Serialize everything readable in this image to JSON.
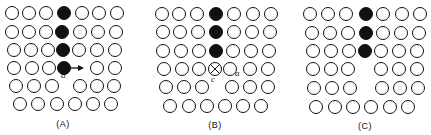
{
  "panels": [
    {
      "label": "(A)",
      "annotation": "a",
      "description": "Vacancy migration: atom moves right into vacancy (arrow a)",
      "rows": [
        {
          "y": 13,
          "cells": [
            {
              "x": 12,
              "t": "o"
            },
            {
              "x": 29,
              "t": "o"
            },
            {
              "x": 46,
              "t": "o"
            },
            {
              "x": 64,
              "t": "f"
            },
            {
              "x": 82,
              "t": "o"
            },
            {
              "x": 99,
              "t": "o"
            },
            {
              "x": 117,
              "t": "o"
            }
          ]
        },
        {
          "y": 32,
          "cells": [
            {
              "x": 12,
              "t": "o"
            },
            {
              "x": 29,
              "t": "o"
            },
            {
              "x": 46,
              "t": "o"
            },
            {
              "x": 62,
              "t": "f"
            },
            {
              "x": 80,
              "t": "o"
            },
            {
              "x": 98,
              "t": "o"
            },
            {
              "x": 116,
              "t": "o"
            }
          ]
        },
        {
          "y": 50,
          "cells": [
            {
              "x": 14,
              "t": "o"
            },
            {
              "x": 31,
              "t": "o"
            },
            {
              "x": 48,
              "t": "o"
            },
            {
              "x": 63,
              "t": "f"
            },
            {
              "x": 79,
              "t": "o"
            },
            {
              "x": 97,
              "t": "o"
            },
            {
              "x": 115,
              "t": "o"
            }
          ]
        },
        {
          "y": 68,
          "cells": [
            {
              "x": 14,
              "t": "o"
            },
            {
              "x": 32,
              "t": "o"
            },
            {
              "x": 49,
              "t": "o"
            },
            {
              "x": 64,
              "t": "f"
            },
            {
              "x": 97,
              "t": "o"
            },
            {
              "x": 115,
              "t": "o"
            }
          ]
        },
        {
          "y": 86,
          "cells": [
            {
              "x": 16,
              "t": "o"
            },
            {
              "x": 34,
              "t": "o"
            },
            {
              "x": 52,
              "t": "o"
            },
            {
              "x": 80,
              "t": "o"
            },
            {
              "x": 97,
              "t": "o"
            },
            {
              "x": 114,
              "t": "o"
            }
          ]
        },
        {
          "y": 104,
          "cells": [
            {
              "x": 20,
              "t": "o"
            },
            {
              "x": 38,
              "t": "o"
            },
            {
              "x": 57,
              "t": "o"
            },
            {
              "x": 75,
              "t": "o"
            },
            {
              "x": 93,
              "t": "o"
            },
            {
              "x": 111,
              "t": "o"
            }
          ]
        }
      ],
      "arrow": {
        "x1": 68,
        "y1": 68,
        "x2": 84,
        "y2": 68
      },
      "annotation_pos": {
        "x": 63,
        "y": 74
      },
      "label_pos": {
        "x": 63,
        "y": 119
      }
    },
    {
      "label": "(B)",
      "annotation_c": "c",
      "annotation_a": "a",
      "description": "Atom at saddle point c between sites",
      "rows": [
        {
          "y": 14,
          "cells": [
            {
              "x": 162,
              "t": "o"
            },
            {
              "x": 179,
              "t": "o"
            },
            {
              "x": 197,
              "t": "o"
            },
            {
              "x": 216,
              "t": "f"
            },
            {
              "x": 234,
              "t": "o"
            },
            {
              "x": 253,
              "t": "o"
            },
            {
              "x": 271,
              "t": "o"
            }
          ]
        },
        {
          "y": 32,
          "cells": [
            {
              "x": 163,
              "t": "o"
            },
            {
              "x": 180,
              "t": "o"
            },
            {
              "x": 198,
              "t": "o"
            },
            {
              "x": 216,
              "t": "f"
            },
            {
              "x": 234,
              "t": "o"
            },
            {
              "x": 252,
              "t": "o"
            },
            {
              "x": 270,
              "t": "o"
            }
          ]
        },
        {
          "y": 51,
          "cells": [
            {
              "x": 163,
              "t": "o"
            },
            {
              "x": 181,
              "t": "o"
            },
            {
              "x": 199,
              "t": "o"
            },
            {
              "x": 216,
              "t": "f"
            },
            {
              "x": 233,
              "t": "o"
            },
            {
              "x": 251,
              "t": "o"
            },
            {
              "x": 269,
              "t": "o"
            }
          ]
        },
        {
          "y": 69,
          "cells": [
            {
              "x": 164,
              "t": "o"
            },
            {
              "x": 182,
              "t": "o"
            },
            {
              "x": 199,
              "t": "o"
            },
            {
              "x": 215,
              "t": "x"
            },
            {
              "x": 230,
              "t": "o"
            },
            {
              "x": 250,
              "t": "o"
            },
            {
              "x": 268,
              "t": "o"
            }
          ]
        },
        {
          "y": 87,
          "cells": [
            {
              "x": 166,
              "t": "o"
            },
            {
              "x": 184,
              "t": "o"
            },
            {
              "x": 202,
              "t": "o"
            },
            {
              "x": 232,
              "t": "o"
            },
            {
              "x": 250,
              "t": "o"
            },
            {
              "x": 268,
              "t": "o"
            }
          ]
        },
        {
          "y": 106,
          "cells": [
            {
              "x": 170,
              "t": "o"
            },
            {
              "x": 189,
              "t": "o"
            },
            {
              "x": 207,
              "t": "o"
            },
            {
              "x": 225,
              "t": "o"
            },
            {
              "x": 243,
              "t": "o"
            },
            {
              "x": 261,
              "t": "o"
            }
          ]
        }
      ],
      "annotation_c_pos": {
        "x": 213,
        "y": 74
      },
      "annotation_a_pos": {
        "x": 236,
        "y": 70
      },
      "label_pos": {
        "x": 215,
        "y": 120
      }
    },
    {
      "label": "(C)",
      "description": "Atom has moved; vacancy now at original site",
      "rows": [
        {
          "y": 14,
          "cells": [
            {
              "x": 310,
              "t": "o"
            },
            {
              "x": 328,
              "t": "o"
            },
            {
              "x": 346,
              "t": "o"
            },
            {
              "x": 366,
              "t": "f"
            },
            {
              "x": 383,
              "t": "o"
            },
            {
              "x": 402,
              "t": "o"
            },
            {
              "x": 420,
              "t": "o"
            }
          ]
        },
        {
          "y": 33,
          "cells": [
            {
              "x": 312,
              "t": "o"
            },
            {
              "x": 330,
              "t": "o"
            },
            {
              "x": 348,
              "t": "o"
            },
            {
              "x": 366,
              "t": "f"
            },
            {
              "x": 383,
              "t": "o"
            },
            {
              "x": 401,
              "t": "o"
            },
            {
              "x": 419,
              "t": "o"
            }
          ]
        },
        {
          "y": 51,
          "cells": [
            {
              "x": 313,
              "t": "o"
            },
            {
              "x": 331,
              "t": "o"
            },
            {
              "x": 349,
              "t": "o"
            },
            {
              "x": 365,
              "t": "f"
            },
            {
              "x": 381,
              "t": "o"
            },
            {
              "x": 399,
              "t": "o"
            },
            {
              "x": 417,
              "t": "o"
            }
          ]
        },
        {
          "y": 69,
          "cells": [
            {
              "x": 313,
              "t": "o"
            },
            {
              "x": 331,
              "t": "o"
            },
            {
              "x": 348,
              "t": "o"
            },
            {
              "x": 381,
              "t": "o"
            },
            {
              "x": 399,
              "t": "o"
            },
            {
              "x": 417,
              "t": "o"
            }
          ]
        },
        {
          "y": 88,
          "cells": [
            {
              "x": 314,
              "t": "o"
            },
            {
              "x": 332,
              "t": "o"
            },
            {
              "x": 350,
              "t": "o"
            },
            {
              "x": 382,
              "t": "o"
            },
            {
              "x": 400,
              "t": "o"
            },
            {
              "x": 418,
              "t": "o"
            }
          ]
        },
        {
          "y": 107,
          "cells": [
            {
              "x": 316,
              "t": "o"
            },
            {
              "x": 335,
              "t": "o"
            },
            {
              "x": 353,
              "t": "o"
            },
            {
              "x": 371,
              "t": "o"
            },
            {
              "x": 390,
              "t": "o"
            },
            {
              "x": 408,
              "t": "o"
            }
          ]
        }
      ],
      "label_pos": {
        "x": 365,
        "y": 121
      }
    }
  ],
  "style": {
    "stroke": "#111111",
    "fill_filled": "#111111",
    "fill_open": "#ffffff",
    "radius": 6.5
  }
}
